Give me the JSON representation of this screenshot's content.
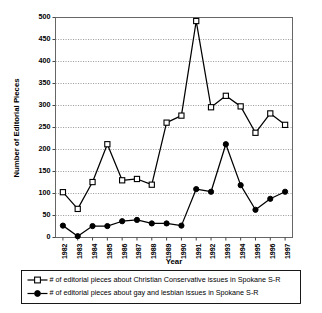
{
  "chart_data": {
    "type": "line",
    "title": "",
    "subtitle": "",
    "xlabel": "Year",
    "ylabel": "Number of Editorial Pieces",
    "xlim": [
      1982,
      1997
    ],
    "ylim": [
      0,
      500
    ],
    "ytick_step": 50,
    "grid": true,
    "grid_axis": "y",
    "grid_style": "dotted",
    "legend_position": "bottom",
    "categories": [
      "1982",
      "1983",
      "1984",
      "1985",
      "1986",
      "1987",
      "1988",
      "1989",
      "1990",
      "1991",
      "1992",
      "1993",
      "1994",
      "1995",
      "1996",
      "1997"
    ],
    "x_tick_labels": [
      "1982",
      "1983",
      "1984",
      "1985",
      "1986",
      "1987",
      "1988",
      "1989",
      "1990",
      "1991",
      "1992",
      "1993",
      "1994",
      "1995",
      "1996",
      "1997"
    ],
    "y_tick_labels": [
      "0",
      "50",
      "100",
      "150",
      "200",
      "250",
      "300",
      "350",
      "400",
      "450",
      "500"
    ],
    "y_tick_values": [
      0,
      50,
      100,
      150,
      200,
      250,
      300,
      350,
      400,
      450,
      500
    ],
    "series": [
      {
        "name": "# of editorial pieces about Christian Conservative issues in Spokane S-R",
        "marker": "open-square",
        "color": "#000000",
        "values": [
          103,
          65,
          126,
          212,
          130,
          133,
          120,
          261,
          277,
          492,
          296,
          322,
          298,
          238,
          282,
          256
        ]
      },
      {
        "name": "# of editorial pieces about gay and lesbian issues in Spokane S-R",
        "marker": "filled-circle",
        "color": "#000000",
        "values": [
          27,
          3,
          26,
          26,
          37,
          40,
          32,
          32,
          27,
          110,
          104,
          212,
          119,
          63,
          88,
          104
        ]
      }
    ]
  },
  "legend": {
    "entries": [
      {
        "label": "# of editorial pieces about Christian Conservative issues in Spokane S-R",
        "marker": "open-square"
      },
      {
        "label": "# of editorial pieces about gay and lesbian issues in Spokane S-R",
        "marker": "filled-circle"
      }
    ]
  },
  "axes": {
    "y_title": "Number of Editorial Pieces",
    "x_title": "Year"
  }
}
